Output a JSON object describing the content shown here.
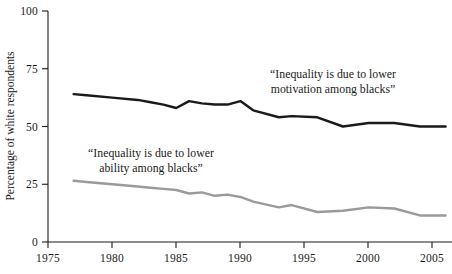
{
  "chart_data": {
    "type": "line",
    "title": "",
    "xlabel": "",
    "ylabel": "Percentage of white respondents",
    "xlim": [
      1975,
      2006.5
    ],
    "ylim": [
      0,
      100
    ],
    "grid": false,
    "legend_position": "inline-annotations",
    "x_ticks": [
      "1975",
      "1980",
      "1985",
      "1990",
      "1995",
      "2000",
      "2005"
    ],
    "x_tick_values": [
      1975,
      1980,
      1985,
      1990,
      1995,
      2000,
      2005
    ],
    "y_ticks": [
      "0",
      "25",
      "50",
      "75",
      "100"
    ],
    "y_tick_values": [
      0,
      25,
      50,
      75,
      100
    ],
    "series": [
      {
        "name": "“Inequality is due to lower motivation among blacks”",
        "color": "#1a1a1a",
        "stroke_width": 2.4,
        "x": [
          1977,
          1978,
          1980,
          1982,
          1983,
          1984,
          1985,
          1986,
          1987,
          1988,
          1989,
          1990,
          1991,
          1993,
          1994,
          1996,
          1998,
          2000,
          2002,
          2004,
          2006
        ],
        "values": [
          64,
          63.5,
          62.5,
          61.5,
          60.5,
          59.5,
          58,
          61,
          60,
          59.5,
          59.5,
          61,
          57,
          54,
          54.5,
          54,
          50,
          51.5,
          51.5,
          50,
          50
        ]
      },
      {
        "name": "“Inequality is due to lower ability among blacks”",
        "color": "#9a9a9a",
        "stroke_width": 2.4,
        "x": [
          1977,
          1978,
          1980,
          1982,
          1983,
          1984,
          1985,
          1986,
          1987,
          1988,
          1989,
          1990,
          1991,
          1993,
          1994,
          1996,
          1998,
          2000,
          2002,
          2004,
          2006
        ],
        "values": [
          26.5,
          26,
          25,
          24,
          23.5,
          23,
          22.5,
          21,
          21.5,
          20,
          20.5,
          19.5,
          17.5,
          15,
          16,
          13,
          13.5,
          15,
          14.5,
          11.5,
          11.5
        ]
      }
    ],
    "annotations": [
      {
        "id": "annotation-motivation",
        "lines": [
          "“Inequality is due to lower",
          "motivation among blacks”"
        ],
        "x_px": 333,
        "y_px": 78,
        "align": "center"
      },
      {
        "id": "annotation-ability",
        "lines": [
          "“Inequality is due to lower",
          "ability among blacks”"
        ],
        "x_px": 151,
        "y_px": 157,
        "align": "center"
      }
    ]
  }
}
